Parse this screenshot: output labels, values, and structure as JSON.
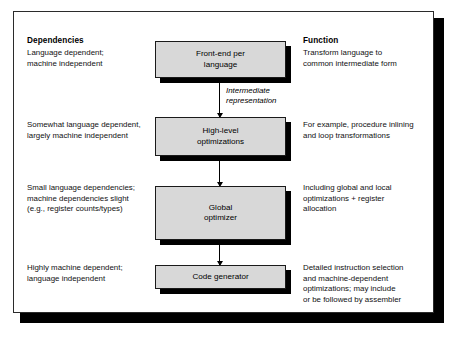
{
  "figure": {
    "columns": {
      "dependencies_heading": "Dependencies",
      "function_heading": "Function"
    },
    "arrow_annotation": "Intermediate\nrepresentation",
    "stages": [
      {
        "box_label": "Front-end per\nlanguage",
        "dependencies": "Language dependent;\nmachine independent",
        "function": "Transform language to\ncommon intermediate form"
      },
      {
        "box_label": "High-level\noptimizations",
        "dependencies": "Somewhat language dependent,\nlargely machine independent",
        "function": "For example, procedure inlining\nand loop transformations"
      },
      {
        "box_label": "Global\noptimizer",
        "dependencies": "Small language dependencies;\nmachine dependencies slight\n(e.g., register counts/types)",
        "function": "Including global and local\noptimizations + register\nallocation"
      },
      {
        "box_label": "Code generator",
        "dependencies": "Highly machine dependent;\nlanguage independent",
        "function": "Detailed instruction selection\nand machine-dependent\noptimizations; may include\nor be followed by assembler"
      }
    ],
    "colors": {
      "box_fill": "#d8d8d8",
      "box_border": "#1a1a1a",
      "shadow": "#000000",
      "panel_background": "#ffffff",
      "text": "#000000"
    }
  }
}
